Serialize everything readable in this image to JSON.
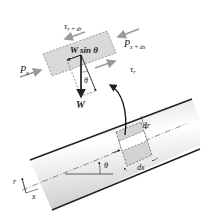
{
  "diagram": {
    "element_labels": {
      "tau_top": "τ",
      "tau_top_sub": "r + dr",
      "tau_bottom": "τ",
      "tau_bottom_sub": "r",
      "p_left": "P",
      "p_left_sub": "x",
      "p_right": "P",
      "p_right_sub": "x + dx",
      "w_sin": "W sin θ",
      "theta_inner": "θ",
      "weight": "W"
    },
    "pipe_labels": {
      "dr": "dr",
      "dx": "dx",
      "theta": "θ",
      "r_axis": "r",
      "x_axis": "x"
    },
    "colors": {
      "element_fill": "#d9d9d9",
      "pipe_fill_light": "#ffffff",
      "pipe_fill_dark": "#cfcfcf",
      "line": "#222222",
      "arrow_gray": "#9a9a9a"
    }
  }
}
